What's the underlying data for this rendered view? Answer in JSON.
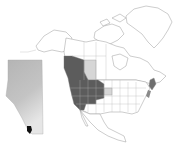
{
  "map": {
    "description": "Distribution map of North America with an inset of Alberta",
    "colors": {
      "background": "#ffffff",
      "land": "#ffffff",
      "borders": "#9a9a9a",
      "range_primary": "#5c5c5c",
      "range_secondary": "#d6d6d6",
      "range_eastern": "#6e6e6e",
      "inset_base": "#bdbdbd",
      "inset_light": "#e4e4e4",
      "inset_point": "#111111"
    },
    "regions": [
      {
        "name": "Western North America range",
        "shade": "dark"
      },
      {
        "name": "Alberta / Saskatchewan area",
        "shade": "light"
      },
      {
        "name": "Eastern seaboard (New England / Maritimes)",
        "shade": "dark"
      },
      {
        "name": "Dakota area",
        "shade": "light"
      }
    ],
    "inset": {
      "name": "Alberta",
      "marked_location": "southwest Alberta"
    }
  }
}
